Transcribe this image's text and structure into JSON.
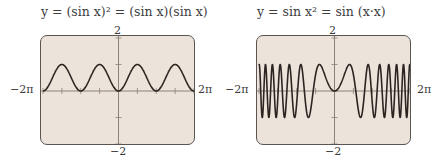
{
  "panels": [
    {
      "title": "y = (sin x)² = (sin x)(sin x)",
      "y_max_label": "2",
      "y_min_label": "−2",
      "x_min_label": "−2π",
      "x_max_label": "2π"
    },
    {
      "title": "y = sin x² = sin (x·x)",
      "y_max_label": "2",
      "y_min_label": "−2",
      "x_min_label": "−2π",
      "x_max_label": "2π"
    }
  ],
  "colors": {
    "screen_bg": "#ece3da",
    "frame": "#5a5550",
    "curve": "#2b2522",
    "axis": "#8a827a"
  },
  "chart_data": [
    {
      "type": "line",
      "title": "y = (sin x)² = (sin x)(sin x)",
      "function": "(sin x)^2",
      "xlabel": "",
      "ylabel": "",
      "xlim": [
        -6.2832,
        6.2832
      ],
      "ylim": [
        -2,
        2
      ],
      "x_tick_labels": [
        "−2π",
        "2π"
      ],
      "y_tick_labels": [
        "−2",
        "2"
      ],
      "x_ticks": [
        -6.2832,
        -4.7124,
        -3.1416,
        -1.5708,
        0,
        1.5708,
        3.1416,
        4.7124,
        6.2832
      ],
      "y_ticks": [
        -2,
        -1,
        0,
        1,
        2
      ],
      "grid": false,
      "series": [
        {
          "name": "y=(sin x)^2",
          "x": [
            -6.2832,
            -4.7124,
            -3.1416,
            -1.5708,
            0,
            1.5708,
            3.1416,
            4.7124,
            6.2832
          ],
          "values": [
            0,
            1,
            0,
            1,
            0,
            1,
            0,
            1,
            0
          ]
        }
      ]
    },
    {
      "type": "line",
      "title": "y = sin x² = sin (x·x)",
      "function": "sin(x^2)",
      "xlabel": "",
      "ylabel": "",
      "xlim": [
        -6.2832,
        6.2832
      ],
      "ylim": [
        -2,
        2
      ],
      "x_tick_labels": [
        "−2π",
        "2π"
      ],
      "y_tick_labels": [
        "−2",
        "2"
      ],
      "y_ticks": [
        -2,
        -1,
        0,
        1,
        2
      ],
      "grid": false,
      "series": [
        {
          "name": "y=sin(x^2)",
          "x": [
            -2.1708,
            -1.2533,
            0,
            1.2533,
            2.1708
          ],
          "values": [
            -1,
            1,
            0,
            1,
            -1
          ]
        }
      ]
    }
  ]
}
